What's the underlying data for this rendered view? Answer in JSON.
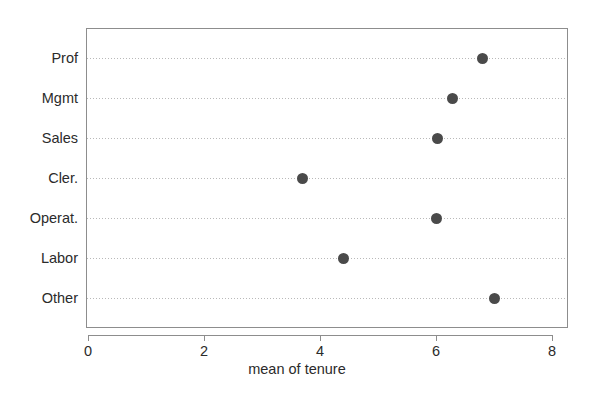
{
  "chart_data": {
    "type": "scatter",
    "subtype": "cleveland-dot-plot",
    "title": "",
    "xlabel": "mean of tenure",
    "ylabel": "",
    "categories": [
      "Prof",
      "Mgmt",
      "Sales",
      "Cler.",
      "Operat.",
      "Labor",
      "Other"
    ],
    "values": [
      6.81,
      6.29,
      6.03,
      3.69,
      6.0,
      4.41,
      7.0
    ],
    "xlim": [
      0,
      8
    ],
    "xticks": [
      0,
      2,
      4,
      6,
      8
    ],
    "xticklabels": [
      "0",
      "2",
      "4",
      "6",
      "8"
    ],
    "grid": true,
    "grid_style": "dotted-horizontal",
    "legend": null,
    "marker": {
      "shape": "circle",
      "filled": true,
      "color": "#4a4a4a",
      "size_px": 11
    },
    "axis_color": "#8d8d8d",
    "grid_color": "#b9b9b9",
    "text_color": "#2b2b2b",
    "background": "#ffffff",
    "points": [
      {
        "category": "Prof",
        "value": 6.81
      },
      {
        "category": "Mgmt",
        "value": 6.29
      },
      {
        "category": "Sales",
        "value": 6.03
      },
      {
        "category": "Cler.",
        "value": 3.69
      },
      {
        "category": "Operat.",
        "value": 6.0
      },
      {
        "category": "Labor",
        "value": 4.41
      },
      {
        "category": "Other",
        "value": 7.0
      }
    ]
  }
}
